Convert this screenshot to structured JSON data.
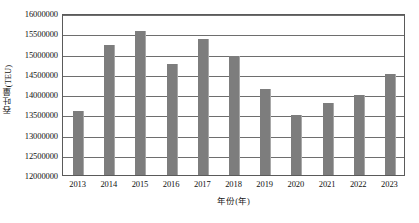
{
  "chart_data": {
    "type": "bar",
    "title": "",
    "xlabel": "年份(年)",
    "ylabel": "吞吐量(TEU)",
    "categories": [
      "2013",
      "2014",
      "2015",
      "2016",
      "2017",
      "2018",
      "2019",
      "2020",
      "2021",
      "2022",
      "2023"
    ],
    "values": [
      13570000,
      15210000,
      15560000,
      14750000,
      15370000,
      14930000,
      14120000,
      13480000,
      13770000,
      13970000,
      14490000
    ],
    "ylim": [
      12000000,
      16000000
    ],
    "ytick_interval": 500000,
    "yticks": [
      12000000,
      12500000,
      13000000,
      13500000,
      14000000,
      14500000,
      15000000,
      15500000,
      16000000
    ],
    "ytick_labels": [
      "12000000",
      "12500000",
      "13000000",
      "13500000",
      "14000000",
      "14500000",
      "15000000",
      "15500000",
      "16000000"
    ],
    "grid": true,
    "grid_axis": "y",
    "legend": false,
    "legend_position": "none",
    "series": [
      {
        "name": "吞吐量(TEU)",
        "color": "#7d7d7d",
        "values": [
          13570000,
          15210000,
          15560000,
          14750000,
          15370000,
          14930000,
          14120000,
          13480000,
          13770000,
          13970000,
          14490000
        ]
      }
    ]
  },
  "colors": {
    "bar": "#7d7d7d",
    "bar_edge": "#a8a8a8",
    "gridline": "#6e6e6e",
    "axis": "#5a5a5a",
    "text": "#111111",
    "background": "#ffffff"
  }
}
